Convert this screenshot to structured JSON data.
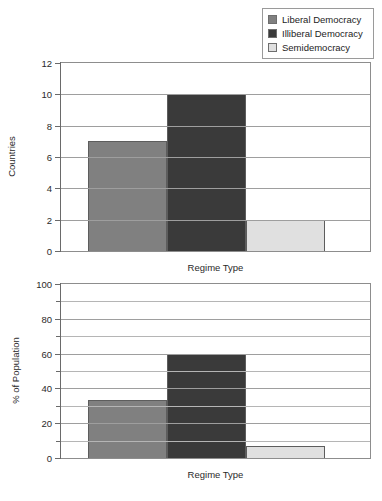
{
  "legend": {
    "position": "top-right",
    "items": [
      {
        "label": "Liberal Democracy",
        "color": "#808080"
      },
      {
        "label": "Illiberal Democracy",
        "color": "#3a3a3a"
      },
      {
        "label": "Semidemocracy",
        "color": "#e0e0e0"
      }
    ]
  },
  "chart_data": [
    {
      "type": "bar",
      "title": "",
      "xlabel": "Regime Type",
      "ylabel": "Countries",
      "categories": [
        "Liberal Democracy",
        "Illiberal Democracy",
        "Semidemocracy"
      ],
      "values": [
        7,
        10,
        2
      ],
      "colors": [
        "#808080",
        "#3a3a3a",
        "#e0e0e0"
      ],
      "ylim": [
        0,
        12
      ],
      "yticks": [
        0,
        2,
        4,
        6,
        8,
        10,
        12
      ],
      "yticklabels": [
        "0",
        "2",
        "4",
        "6",
        "8",
        "10",
        "12"
      ],
      "yminorticks": [],
      "grid": true,
      "legend": "top-right"
    },
    {
      "type": "bar",
      "title": "",
      "xlabel": "Regime Type",
      "ylabel": "% of Population",
      "categories": [
        "Liberal Democracy",
        "Illiberal Democracy",
        "Semidemocracy"
      ],
      "values": [
        33.5,
        60,
        7
      ],
      "colors": [
        "#808080",
        "#3a3a3a",
        "#e0e0e0"
      ],
      "ylim": [
        0,
        100
      ],
      "yticks": [
        0,
        20,
        40,
        60,
        80,
        100
      ],
      "yticklabels": [
        "0",
        "20",
        "40",
        "60",
        "80",
        "100"
      ],
      "yminorticks": [
        10,
        30,
        50,
        70,
        90
      ],
      "grid": true,
      "legend": "none"
    }
  ]
}
